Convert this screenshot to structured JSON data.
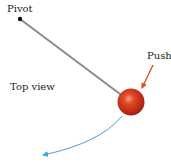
{
  "diagram": {
    "labels": {
      "pivot": "Pivot",
      "push": "Push",
      "view": "Top view"
    },
    "colors": {
      "rod": "#8a8a8a",
      "pivot_dot": "#111111",
      "ball": "#c8301a",
      "ball_highlight": "#f08a6a",
      "push_arrow": "#d9532b",
      "path_arrow": "#4a9fd8",
      "text": "#222222"
    },
    "icons": {
      "pivot": "pivot-dot-icon",
      "ball": "ball-icon",
      "push": "push-arrow-icon",
      "path": "motion-path-arrow-icon"
    }
  }
}
